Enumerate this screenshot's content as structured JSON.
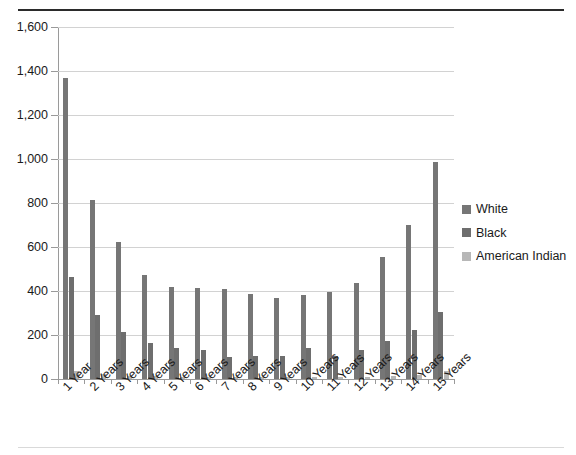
{
  "chart_data": {
    "type": "bar",
    "title": "",
    "subtitle": "",
    "xlabel": "",
    "ylabel": "",
    "ylim": [
      0,
      1600
    ],
    "ytick_step": 200,
    "ytick_labels": [
      "0",
      "200",
      "400",
      "600",
      "800",
      "1,000",
      "1,200",
      "1,400",
      "1,600"
    ],
    "ytick_values": [
      0,
      200,
      400,
      600,
      800,
      1000,
      1200,
      1400,
      1600
    ],
    "grid": true,
    "grid_axis": "y",
    "legend_position": "right",
    "orientation": "vertical",
    "bar_grouping": "grouped",
    "categories": [
      "1 Year",
      "2 Years",
      "3 Years",
      "4 Years",
      "5 Years",
      "6 Years",
      "7 Years",
      "8 Years",
      "9 Years",
      "10 Years",
      "11 Years",
      "12 Years",
      "13 Years",
      "14 Years",
      "15 Years"
    ],
    "series": [
      {
        "name": "White",
        "color": "#767676",
        "values": [
          1370,
          815,
          625,
          475,
          420,
          415,
          410,
          385,
          370,
          380,
          395,
          435,
          555,
          700,
          985
        ]
      },
      {
        "name": "Black",
        "color": "#6e6e6e",
        "values": [
          465,
          290,
          215,
          165,
          140,
          130,
          100,
          105,
          105,
          140,
          105,
          130,
          175,
          225,
          305
        ]
      },
      {
        "name": "American Indian",
        "color": "#b7b7b7",
        "values": [
          35,
          25,
          15,
          15,
          10,
          10,
          10,
          10,
          10,
          10,
          10,
          10,
          15,
          20,
          35
        ]
      }
    ]
  },
  "legend": {
    "items": [
      {
        "label": "White",
        "color": "#767676"
      },
      {
        "label": "Black",
        "color": "#6e6e6e"
      },
      {
        "label": "American Indian",
        "color": "#b7b7b7"
      }
    ]
  }
}
